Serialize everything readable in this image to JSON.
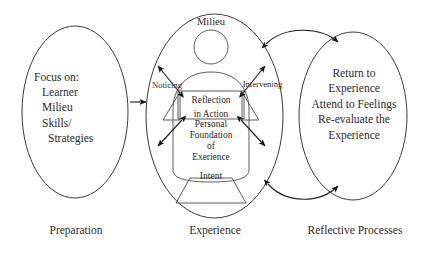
{
  "diagram": {
    "stroke_color": "#3a3a3a",
    "text_color": "#2b2b2b",
    "background_color": "#ffffff",
    "stages": [
      {
        "id": "preparation",
        "caption": "Preparation",
        "lines": [
          "Focus on:",
          "Learner",
          "Milieu",
          "Skills/",
          "Strategies"
        ]
      },
      {
        "id": "experience",
        "caption": "Experience",
        "top_label": "Milieu",
        "left_label": "Noticing",
        "right_label": "Intervening",
        "box_lines": [
          "Reflection",
          "in Action"
        ],
        "body_lines": [
          "Personal",
          "Foundation",
          "of",
          "Exerience"
        ],
        "base_label": "Intent"
      },
      {
        "id": "reflective-processes",
        "caption": "Reflective Processes",
        "lines": [
          "Return to",
          "Experience",
          "Attend to Feelings",
          "Re-evaluate the",
          "Experience"
        ]
      }
    ],
    "connectors": {
      "prep_to_experience": "single-headed-arrow-right",
      "experience_to_reflective_top": "double-headed-curved-arrow",
      "experience_to_reflective_bottom": "double-headed-curved-arrow",
      "radiating": "four-double-headed-diagonal-arrows"
    }
  }
}
